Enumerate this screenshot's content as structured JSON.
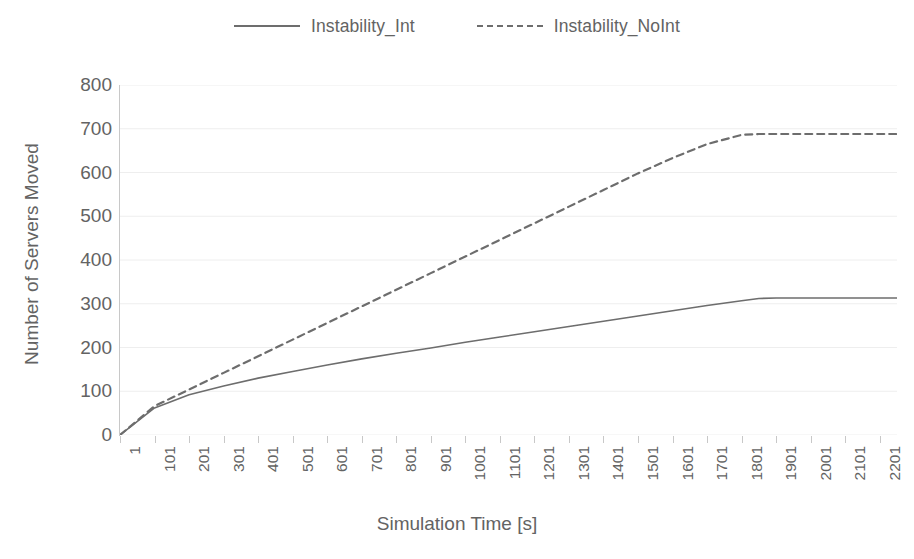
{
  "chart_data": {
    "type": "line",
    "title": "",
    "xlabel": "Simulation Time [s]",
    "ylabel": "Number of Servers Moved",
    "xlim": [
      1,
      2251
    ],
    "ylim": [
      0,
      800
    ],
    "ytick_step": 100,
    "xtick_step": 100,
    "grid": true,
    "grid_axis": "y",
    "legend_position": "top-center",
    "xticklabels": [
      "1",
      "101",
      "201",
      "301",
      "401",
      "501",
      "601",
      "701",
      "801",
      "901",
      "1001",
      "1101",
      "1201",
      "1301",
      "1401",
      "1501",
      "1601",
      "1701",
      "1801",
      "1901",
      "2001",
      "2101",
      "2201"
    ],
    "yticklabels": [
      "0",
      "100",
      "200",
      "300",
      "400",
      "500",
      "600",
      "700",
      "800"
    ],
    "x": [
      1,
      101,
      201,
      301,
      401,
      501,
      601,
      701,
      801,
      901,
      1001,
      1101,
      1201,
      1301,
      1401,
      1501,
      1601,
      1701,
      1801,
      1851,
      1901,
      2001,
      2101,
      2201,
      2251
    ],
    "series": [
      {
        "name": "Instability_Int",
        "style": "solid",
        "color": "#6d6d6d",
        "values": [
          0,
          62,
          92,
          112,
          130,
          145,
          160,
          174,
          187,
          199,
          212,
          224,
          236,
          248,
          260,
          272,
          284,
          296,
          307,
          312,
          313,
          313,
          313,
          313,
          313
        ]
      },
      {
        "name": "Instability_NoInt",
        "style": "dashed",
        "color": "#6d6d6d",
        "values": [
          0,
          66,
          104,
          142,
          180,
          218,
          256,
          294,
          332,
          370,
          408,
          446,
          484,
          522,
          560,
          598,
          633,
          665,
          686,
          688,
          688,
          688,
          688,
          688,
          688
        ]
      }
    ]
  },
  "legend": {
    "entries": [
      {
        "label": "Instability_Int",
        "style": "solid"
      },
      {
        "label": "Instability_NoInt",
        "style": "dashed"
      }
    ]
  },
  "colors": {
    "line": "#6d6d6d",
    "grid": "#eeeeee",
    "axis": "#c8c8c8",
    "text": "#636363",
    "background": "#ffffff"
  }
}
